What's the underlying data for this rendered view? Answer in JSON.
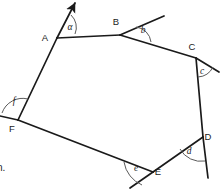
{
  "figure": {
    "stroke_color": "#1a1a1a",
    "arc_color": "#5a5a5a",
    "background": "#ffffff",
    "width": 221,
    "height": 190,
    "vertices": [
      {
        "name": "A",
        "label": "A",
        "x": 57,
        "y": 38,
        "label_x": 45,
        "label_y": 41
      },
      {
        "name": "B",
        "label": "B",
        "x": 120,
        "y": 35,
        "label_x": 116,
        "label_y": 25
      },
      {
        "name": "C",
        "label": "C",
        "x": 196,
        "y": 58,
        "label_x": 192,
        "label_y": 50
      },
      {
        "name": "D",
        "label": "D",
        "x": 203,
        "y": 137,
        "label_x": 208,
        "label_y": 140
      },
      {
        "name": "E",
        "label": "E",
        "x": 153,
        "y": 172,
        "label_x": 158,
        "label_y": 175
      },
      {
        "name": "F",
        "label": "F",
        "x": 18,
        "y": 120,
        "label_x": 12,
        "label_y": 132
      }
    ],
    "sides": [
      {
        "name": "side-AB",
        "from": "A",
        "to": "B"
      },
      {
        "name": "side-BC",
        "from": "B",
        "to": "C"
      },
      {
        "name": "side-CD",
        "from": "C",
        "to": "D"
      },
      {
        "name": "side-DE",
        "from": "D",
        "to": "E"
      },
      {
        "name": "side-EF",
        "from": "E",
        "to": "F"
      },
      {
        "name": "side-FA",
        "from": "F",
        "to": "A"
      }
    ],
    "rays": [
      {
        "name": "ray-A-arrow",
        "from_x": 57,
        "from_y": 38,
        "to_x": 75,
        "to_y": 3,
        "arrow": true
      },
      {
        "name": "ray-B-extension",
        "from_x": 120,
        "from_y": 35,
        "to_x": 164,
        "to_y": 16,
        "arrow": false
      },
      {
        "name": "ray-C-extension",
        "from_x": 196,
        "from_y": 58,
        "to_x": 219,
        "to_y": 72,
        "arrow": false
      },
      {
        "name": "ray-D-extension",
        "from_x": 203,
        "from_y": 137,
        "to_x": 208,
        "to_y": 178,
        "arrow": false
      },
      {
        "name": "ray-E-extension",
        "from_x": 153,
        "from_y": 172,
        "to_x": 130,
        "to_y": 188,
        "arrow": false
      },
      {
        "name": "ray-F-extension",
        "from_x": 18,
        "from_y": 120,
        "to_x": 0,
        "to_y": 116,
        "arrow": false
      }
    ],
    "angles": [
      {
        "name": "angle-alpha",
        "label": "α",
        "vertex": "A",
        "label_x": 70,
        "label_y": 30,
        "arc": "M 71 15 A 17 17 0 0 1 75 34"
      },
      {
        "name": "angle-b",
        "label": "b",
        "vertex": "B",
        "label_x": 143,
        "label_y": 33,
        "arc": "M 136 27 A 17 17 0 0 1 151 42"
      },
      {
        "name": "angle-c",
        "label": "c",
        "vertex": "C",
        "label_x": 202,
        "label_y": 74,
        "arc": "M 198 77 A 18 18 0 0 0 213 67"
      },
      {
        "name": "angle-d",
        "label": "d",
        "vertex": "D",
        "label_x": 189,
        "label_y": 154,
        "arc": "M 180 149 A 24 24 0 0 0 205 161"
      },
      {
        "name": "angle-e",
        "label": "e",
        "vertex": "E",
        "label_x": 136,
        "label_y": 171,
        "arc": "M 124 162 A 30 30 0 0 0 142 185"
      },
      {
        "name": "angle-f",
        "label": "f",
        "vertex": "F",
        "label_x": 14,
        "label_y": 104,
        "arc": "M 28 99 A 22 22 0 0 0 2 113"
      }
    ]
  },
  "corner_text": {
    "text": "n.",
    "x": -3,
    "y": 162
  }
}
